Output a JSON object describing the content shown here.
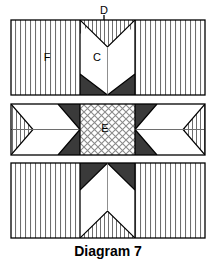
{
  "figure": {
    "caption": "Diagram 7",
    "type": "technical-cross-section-diagram",
    "width": 216,
    "height": 262,
    "background_color": "#ffffff"
  },
  "colors": {
    "outline": "#000000",
    "dark_fill": "#3a3a3a",
    "white_fill": "#ffffff",
    "hatch_line": "#6e6e6e",
    "crosshatch_line": "#8a8a8a",
    "label_text": "#000000"
  },
  "labels": {
    "d": "D",
    "c": "C",
    "f": "F",
    "e": "E"
  },
  "annotations": {
    "arrow_d": {
      "label": "D",
      "direction": "down",
      "x": 104,
      "label_y": 11,
      "arrow_top_y": 14,
      "arrow_tip_y": 34
    }
  },
  "panels": [
    {
      "name": "panel-top",
      "index": 1,
      "x": 11,
      "y": 20,
      "width": 194,
      "height": 75,
      "left_region": {
        "name": "region-f-left",
        "fill": "vertical-hatch",
        "label": "F",
        "label_x": 47,
        "label_y": 58
      },
      "right_region": {
        "name": "region-f-right",
        "fill": "vertical-hatch",
        "label": ""
      },
      "center_region": {
        "name": "region-c",
        "x": 80,
        "width": 55,
        "label": "C",
        "label_x": 97,
        "label_y": 58,
        "notch": "v-notch-top",
        "dark_corners": "bottom"
      }
    },
    {
      "name": "panel-middle",
      "index": 2,
      "x": 11,
      "y": 104,
      "width": 194,
      "height": 51,
      "left_region": {
        "name": "region-arrow-left",
        "fill": "white-with-hatched-tip",
        "tip": "vertical-hatch-triangle"
      },
      "right_region": {
        "name": "region-arrow-right",
        "fill": "white-with-hatched-tip",
        "tip": "vertical-hatch-triangle"
      },
      "center_region": {
        "name": "region-e",
        "x": 80,
        "width": 55,
        "fill": "crosshatch",
        "label": "E",
        "label_x": 105,
        "label_y": 129
      },
      "dark_wedges": "flanking-center"
    },
    {
      "name": "panel-bottom",
      "index": 3,
      "x": 11,
      "y": 163,
      "width": 194,
      "height": 75,
      "left_region": {
        "name": "region-hatch-left",
        "fill": "vertical-hatch",
        "label": ""
      },
      "right_region": {
        "name": "region-hatch-right",
        "fill": "vertical-hatch",
        "label": ""
      },
      "center_region": {
        "name": "region-center-bottom",
        "x": 80,
        "width": 55,
        "dark_corners": "top",
        "notch": "chevron-hatch-bottom"
      }
    }
  ]
}
